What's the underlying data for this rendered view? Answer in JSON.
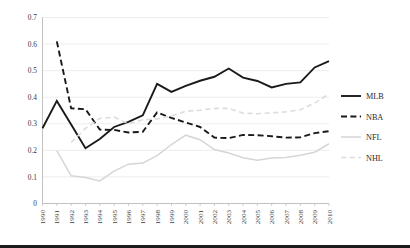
{
  "chart_data": {
    "type": "line",
    "title": "",
    "subtitle": "",
    "xlabel": "",
    "ylabel": "",
    "xlim": [
      1990,
      2010
    ],
    "ylim": [
      0,
      0.7
    ],
    "grid": true,
    "legend_position": "right",
    "ytick_labels": [
      "0.7",
      "0.6",
      "0.5",
      "0.4",
      "0.3",
      "0.2",
      "0.1",
      "0"
    ],
    "ytick_values": [
      0.7,
      0.6,
      0.5,
      0.4,
      0.3,
      0.2,
      0.1,
      0
    ],
    "categories": [
      "1990",
      "1991",
      "1992",
      "1993",
      "1994",
      "1995",
      "1996",
      "1997",
      "1998",
      "1999",
      "2000",
      "2001",
      "2002",
      "2003",
      "2004",
      "2005",
      "2006",
      "2007",
      "2008",
      "2009",
      "2010"
    ],
    "series": [
      {
        "name": "MLB",
        "color": "#1a1a1a",
        "style": "solid",
        "values": [
          0.283,
          0.386,
          0.297,
          0.208,
          0.243,
          0.288,
          0.307,
          0.332,
          0.45,
          0.42,
          0.443,
          0.462,
          0.477,
          0.508,
          0.474,
          0.461,
          0.437,
          0.45,
          0.456,
          0.512,
          0.536
        ]
      },
      {
        "name": "NBA",
        "color": "#1a1a1a",
        "style": "dashed",
        "values": [
          null,
          0.61,
          0.358,
          0.355,
          0.278,
          0.277,
          0.267,
          0.27,
          0.343,
          0.322,
          0.305,
          0.288,
          0.248,
          0.246,
          0.258,
          0.257,
          0.253,
          0.248,
          0.249,
          0.265,
          0.272
        ]
      },
      {
        "name": "NFL",
        "color": "#d6d6d6",
        "style": "solid",
        "values": [
          null,
          0.199,
          0.104,
          0.098,
          0.085,
          0.122,
          0.148,
          0.152,
          0.18,
          0.222,
          0.257,
          0.24,
          0.203,
          0.19,
          0.172,
          0.163,
          0.171,
          0.173,
          0.182,
          0.193,
          0.225
        ]
      },
      {
        "name": "NHL",
        "color": "#dcdcdc",
        "style": "dashed",
        "values": [
          null,
          null,
          0.23,
          0.283,
          0.32,
          0.325,
          0.3,
          0.315,
          0.318,
          0.33,
          0.347,
          0.351,
          0.358,
          0.358,
          0.34,
          0.338,
          0.341,
          0.345,
          0.353,
          0.378,
          0.412
        ]
      }
    ]
  },
  "legend": {
    "items": [
      {
        "label": "MLB"
      },
      {
        "label": "NBA"
      },
      {
        "label": "NFL"
      },
      {
        "label": "NHL"
      }
    ]
  }
}
